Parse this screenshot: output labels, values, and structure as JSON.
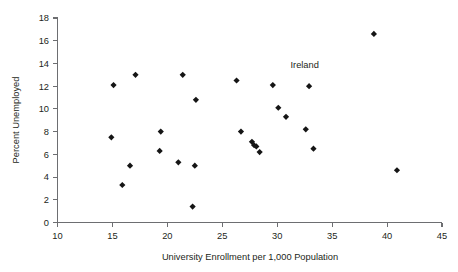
{
  "chart_data": {
    "type": "scatter",
    "title": "",
    "xlabel": "University Enrollment per 1,000 Population",
    "ylabel": "Percent Unemployed",
    "xlim": [
      10,
      45
    ],
    "ylim": [
      0,
      18
    ],
    "xticks": [
      10,
      15,
      20,
      25,
      30,
      35,
      40,
      45
    ],
    "yticks": [
      0,
      2,
      4,
      6,
      8,
      10,
      12,
      14,
      16,
      18
    ],
    "grid": false,
    "legend": false,
    "marker": "diamond",
    "marker_color": "#151515",
    "points": [
      {
        "x": 14.9,
        "y": 7.5
      },
      {
        "x": 15.1,
        "y": 12.1
      },
      {
        "x": 15.9,
        "y": 3.3
      },
      {
        "x": 16.6,
        "y": 5.0
      },
      {
        "x": 17.1,
        "y": 13.0
      },
      {
        "x": 19.3,
        "y": 6.3
      },
      {
        "x": 19.4,
        "y": 8.0
      },
      {
        "x": 21.0,
        "y": 5.3
      },
      {
        "x": 21.4,
        "y": 13.0
      },
      {
        "x": 22.3,
        "y": 1.4
      },
      {
        "x": 22.5,
        "y": 5.0
      },
      {
        "x": 22.6,
        "y": 10.8
      },
      {
        "x": 26.3,
        "y": 12.5
      },
      {
        "x": 26.7,
        "y": 8.0
      },
      {
        "x": 27.7,
        "y": 7.1
      },
      {
        "x": 27.9,
        "y": 6.8
      },
      {
        "x": 28.1,
        "y": 6.7
      },
      {
        "x": 28.4,
        "y": 6.2
      },
      {
        "x": 29.6,
        "y": 12.1
      },
      {
        "x": 30.1,
        "y": 10.1
      },
      {
        "x": 30.8,
        "y": 9.3
      },
      {
        "x": 32.6,
        "y": 8.2
      },
      {
        "x": 32.9,
        "y": 12.0
      },
      {
        "x": 33.3,
        "y": 6.5
      },
      {
        "x": 38.8,
        "y": 16.6
      },
      {
        "x": 40.9,
        "y": 4.6
      }
    ],
    "annotations": [
      {
        "label": "Ireland",
        "x": 32.5,
        "y": 13.6
      }
    ]
  }
}
